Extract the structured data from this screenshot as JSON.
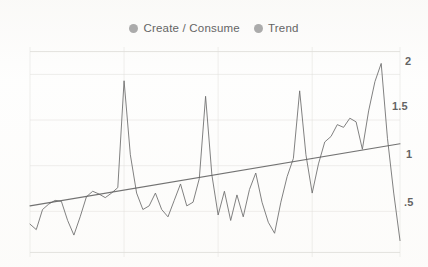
{
  "legend": {
    "position": "top-center",
    "entries": [
      {
        "label": "Create / Consume",
        "color": "#8c8c8c",
        "icon": "legend-dot-icon"
      },
      {
        "label": "Trend",
        "color": "#8c8c8c",
        "icon": "legend-dot-icon"
      }
    ]
  },
  "axis": {
    "y_side": "right",
    "ticks": [
      {
        "label": "2",
        "value": 2.0
      },
      {
        "label": "1.5",
        "value": 1.5
      },
      {
        "label": "1",
        "value": 1.0
      },
      {
        "label": ".5",
        "value": 0.5
      }
    ]
  },
  "colors": {
    "series": "#6f6f6f",
    "trend": "#5e5e5e",
    "grid": "#e2e0dc",
    "background": "#fdfdfc",
    "tick_text": "#3d3d3d"
  },
  "chart_data": {
    "type": "line",
    "title": "",
    "subtitle": "",
    "xlabel": "",
    "ylabel": "",
    "grid": true,
    "legend_position": "top-center",
    "ylim": [
      0.0,
      2.3
    ],
    "xlim": [
      0,
      59
    ],
    "yticks": [
      0.5,
      1.0,
      1.5,
      2.0
    ],
    "ytick_labels": [
      ".5",
      "1",
      "1.5",
      "2"
    ],
    "xtick_labels": [],
    "series": [
      {
        "name": "Create / Consume",
        "type": "line",
        "color": "#6f6f6f",
        "x": [
          0,
          1,
          2,
          3,
          4,
          5,
          6,
          7,
          8,
          9,
          10,
          11,
          12,
          13,
          14,
          15,
          16,
          17,
          18,
          19,
          20,
          21,
          22,
          23,
          24,
          25,
          26,
          27,
          28,
          29,
          30,
          31,
          32,
          33,
          34,
          35,
          36,
          37,
          38,
          39,
          40,
          41,
          42,
          43,
          44,
          45,
          46,
          47,
          48,
          49,
          50,
          51,
          52,
          53,
          54,
          55,
          56,
          57,
          58,
          59
        ],
        "values": [
          0.36,
          0.3,
          0.52,
          0.58,
          0.62,
          0.61,
          0.4,
          0.24,
          0.44,
          0.66,
          0.72,
          0.69,
          0.65,
          0.7,
          0.76,
          1.93,
          1.12,
          0.7,
          0.52,
          0.56,
          0.7,
          0.52,
          0.44,
          0.62,
          0.8,
          0.56,
          0.6,
          0.86,
          1.76,
          0.9,
          0.46,
          0.72,
          0.4,
          0.68,
          0.44,
          0.74,
          0.92,
          0.6,
          0.38,
          0.26,
          0.6,
          0.88,
          1.08,
          1.82,
          1.12,
          0.7,
          1.02,
          1.26,
          1.32,
          1.45,
          1.42,
          1.52,
          1.48,
          1.18,
          1.6,
          1.92,
          2.12,
          1.3,
          0.7,
          0.18
        ]
      },
      {
        "name": "Trend",
        "type": "line",
        "color": "#5e5e5e",
        "fit": "linear",
        "x": [
          0,
          59
        ],
        "values": [
          0.56,
          1.24
        ]
      }
    ]
  }
}
